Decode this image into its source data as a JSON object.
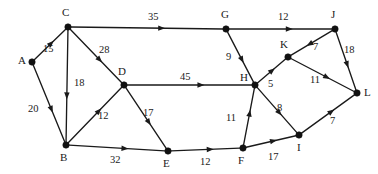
{
  "figure": {
    "type": "directed-weighted-graph",
    "width": 378,
    "height": 174,
    "background_color": "#ffffff",
    "ink_color": "#1a1a1a"
  },
  "chart_data": {
    "type": "diagram",
    "title": "",
    "xlabel": "",
    "ylabel": "",
    "directed": true,
    "weighted": true,
    "node_count": 12,
    "edge_count": 20,
    "nodes": [
      {
        "id": "A",
        "label": "A",
        "x": 32,
        "y": 62,
        "label_x": 18,
        "label_y": 55
      },
      {
        "id": "B",
        "label": "B",
        "x": 66,
        "y": 145,
        "label_x": 60,
        "label_y": 152
      },
      {
        "id": "C",
        "label": "C",
        "x": 68,
        "y": 27,
        "label_x": 62,
        "label_y": 7
      },
      {
        "id": "D",
        "label": "D",
        "x": 124,
        "y": 85,
        "label_x": 118,
        "label_y": 66
      },
      {
        "id": "E",
        "label": "E",
        "x": 168,
        "y": 151,
        "label_x": 163,
        "label_y": 158
      },
      {
        "id": "F",
        "label": "F",
        "x": 243,
        "y": 148,
        "label_x": 238,
        "label_y": 155
      },
      {
        "id": "G",
        "label": "G",
        "x": 226,
        "y": 29,
        "label_x": 221,
        "label_y": 9
      },
      {
        "id": "H",
        "label": "H",
        "x": 255,
        "y": 85,
        "label_x": 240,
        "label_y": 72
      },
      {
        "id": "I",
        "label": "I",
        "x": 299,
        "y": 135,
        "label_x": 297,
        "label_y": 142
      },
      {
        "id": "J",
        "label": "J",
        "x": 335,
        "y": 29,
        "label_x": 331,
        "label_y": 9
      },
      {
        "id": "K",
        "label": "K",
        "x": 288,
        "y": 57,
        "label_x": 280,
        "label_y": 39
      },
      {
        "id": "L",
        "label": "L",
        "x": 357,
        "y": 93,
        "label_x": 364,
        "label_y": 87
      }
    ],
    "edges": [
      {
        "from": "A",
        "to": "C",
        "weight": 15,
        "label": "15",
        "label_x": 43,
        "label_y": 44
      },
      {
        "from": "A",
        "to": "B",
        "weight": 20,
        "label": "20",
        "label_x": 28,
        "label_y": 104
      },
      {
        "from": "C",
        "to": "B",
        "weight": 18,
        "label": "18",
        "label_x": 74,
        "label_y": 78
      },
      {
        "from": "C",
        "to": "D",
        "weight": 28,
        "label": "28",
        "label_x": 99,
        "label_y": 45
      },
      {
        "from": "C",
        "to": "G",
        "weight": 35,
        "label": "35",
        "label_x": 148,
        "label_y": 12
      },
      {
        "from": "B",
        "to": "D",
        "weight": 12,
        "label": "12",
        "label_x": 98,
        "label_y": 111
      },
      {
        "from": "B",
        "to": "E",
        "weight": 32,
        "label": "32",
        "label_x": 110,
        "label_y": 155
      },
      {
        "from": "D",
        "to": "E",
        "weight": 17,
        "label": "17",
        "label_x": 143,
        "label_y": 108
      },
      {
        "from": "D",
        "to": "H",
        "weight": 45,
        "label": "45",
        "label_x": 180,
        "label_y": 72
      },
      {
        "from": "E",
        "to": "F",
        "weight": 12,
        "label": "12",
        "label_x": 200,
        "label_y": 157
      },
      {
        "from": "G",
        "to": "J",
        "weight": 12,
        "label": "12",
        "label_x": 278,
        "label_y": 12
      },
      {
        "from": "G",
        "to": "H",
        "weight": 9,
        "label": "9",
        "label_x": 226,
        "label_y": 52
      },
      {
        "from": "F",
        "to": "H",
        "weight": 11,
        "label": "11",
        "label_x": 226,
        "label_y": 113
      },
      {
        "from": "F",
        "to": "I",
        "weight": 17,
        "label": "17",
        "label_x": 268,
        "label_y": 152
      },
      {
        "from": "H",
        "to": "K",
        "weight": 5,
        "label": "5",
        "label_x": 268,
        "label_y": 79
      },
      {
        "from": "H",
        "to": "I",
        "weight": 8,
        "label": "8",
        "label_x": 277,
        "label_y": 103
      },
      {
        "from": "J",
        "to": "K",
        "weight": 7,
        "label": "7",
        "label_x": 313,
        "label_y": 42
      },
      {
        "from": "J",
        "to": "L",
        "weight": 18,
        "label": "18",
        "label_x": 344,
        "label_y": 45
      },
      {
        "from": "K",
        "to": "L",
        "weight": 11,
        "label": "11",
        "label_x": 310,
        "label_y": 75
      },
      {
        "from": "I",
        "to": "L",
        "weight": 7,
        "label": "7",
        "label_x": 330,
        "label_y": 116
      }
    ]
  }
}
